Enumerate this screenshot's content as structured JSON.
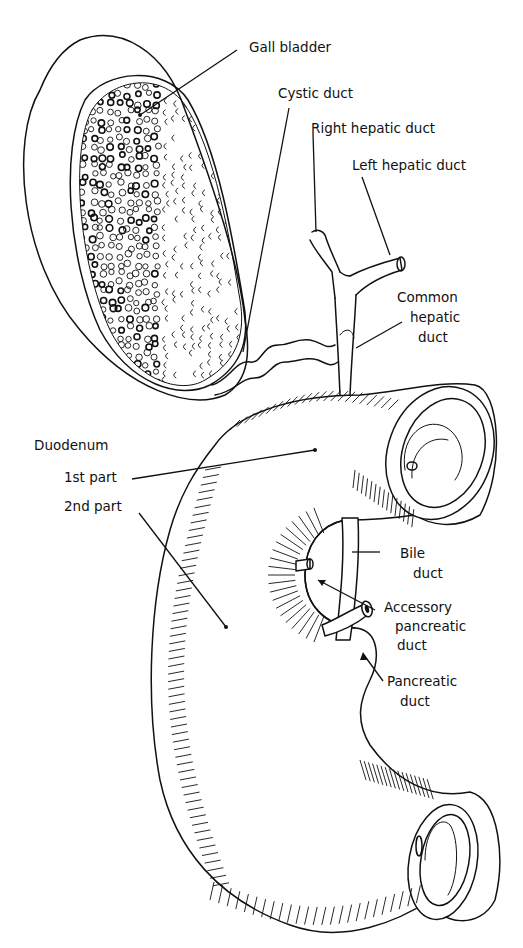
{
  "figure": {
    "line_color": "#111111",
    "background_color": "#ffffff"
  },
  "labels": {
    "gall_bladder": "Gall bladder",
    "cystic_duct": "Cystic duct",
    "right_hepatic_duct": "Right hepatic duct",
    "left_hepatic_duct": "Left hepatic duct",
    "common_hepatic_duct_line1": "Common",
    "common_hepatic_duct_line2": "hepatic",
    "common_hepatic_duct_line3": "duct",
    "duodenum": "Duodenum",
    "first_part": "1st part",
    "second_part": "2nd part",
    "bile_duct_line1": "Bile",
    "bile_duct_line2": "duct",
    "accessory_pancreatic_duct_line1": "Accessory",
    "accessory_pancreatic_duct_line2": "pancreatic",
    "accessory_pancreatic_duct_line3": "duct",
    "pancreatic_duct_line1": "Pancreatic",
    "pancreatic_duct_line2": "duct"
  }
}
